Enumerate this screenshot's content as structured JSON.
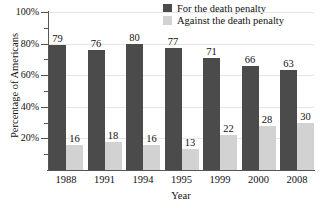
{
  "chart_data": {
    "type": "bar",
    "title": "",
    "xlabel": "Year",
    "ylabel": "Percentage of Americans",
    "categories": [
      "1988",
      "1991",
      "1994",
      "1995",
      "1999",
      "2000",
      "2008"
    ],
    "series": [
      {
        "name": "For the death penalty",
        "color": "#4b4b4b",
        "values": [
          79,
          76,
          80,
          77,
          71,
          66,
          63
        ]
      },
      {
        "name": "Against the death penalty",
        "color": "#d2d2d2",
        "values": [
          16,
          18,
          16,
          13,
          22,
          28,
          30
        ]
      }
    ],
    "ylim": [
      0,
      100
    ],
    "ytick_labels": [
      "100%",
      "80%",
      "60%",
      "40%",
      "20%"
    ],
    "ytick_values": [
      100,
      80,
      60,
      40,
      20
    ],
    "yminor_values": [
      90,
      70,
      50,
      30,
      10
    ],
    "grid": true,
    "legend_position": "top-right",
    "value_labels_shown": true
  },
  "legend": {
    "items": [
      {
        "label": "For the death penalty",
        "color": "#4b4b4b"
      },
      {
        "label": "Against the death penalty",
        "color": "#d2d2d2"
      }
    ]
  },
  "axes": {
    "x_title": "Year",
    "y_title": "Percentage of Americans"
  }
}
